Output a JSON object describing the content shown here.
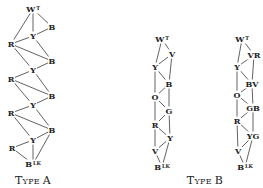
{
  "diagrams": [
    {
      "caption_first": "T",
      "caption_rest": "YPE A",
      "caption": "Type A",
      "nodes": [
        {
          "id": "a0",
          "label": "W",
          "sup": "T",
          "x": 33,
          "y": 9
        },
        {
          "id": "a1",
          "label": "B",
          "sup": "",
          "x": 52,
          "y": 27
        },
        {
          "id": "a2",
          "label": "Y",
          "sup": "",
          "x": 33,
          "y": 36
        },
        {
          "id": "a3",
          "label": "R",
          "sup": "",
          "x": 11,
          "y": 44
        },
        {
          "id": "a4",
          "label": "B",
          "sup": "",
          "x": 52,
          "y": 61
        },
        {
          "id": "a5",
          "label": "Y",
          "sup": "",
          "x": 33,
          "y": 70
        },
        {
          "id": "a6",
          "label": "R",
          "sup": "",
          "x": 11,
          "y": 79
        },
        {
          "id": "a7",
          "label": "B",
          "sup": "",
          "x": 52,
          "y": 96
        },
        {
          "id": "a8",
          "label": "Y",
          "sup": "",
          "x": 33,
          "y": 105
        },
        {
          "id": "a9",
          "label": "R",
          "sup": "",
          "x": 11,
          "y": 113
        },
        {
          "id": "a10",
          "label": "B",
          "sup": "",
          "x": 52,
          "y": 130
        },
        {
          "id": "a11",
          "label": "Y",
          "sup": "",
          "x": 33,
          "y": 140
        },
        {
          "id": "a12",
          "label": "R",
          "sup": "",
          "x": 12,
          "y": 148
        },
        {
          "id": "a13",
          "label": "B",
          "sup": "LK",
          "x": 33,
          "y": 164
        }
      ],
      "edges": [
        [
          "a0",
          "a1"
        ],
        [
          "a0",
          "a2"
        ],
        [
          "a0",
          "a3"
        ],
        [
          "a2",
          "a1"
        ],
        [
          "a2",
          "a3"
        ],
        [
          "a3",
          "a4"
        ],
        [
          "a2",
          "a4"
        ],
        [
          "a4",
          "a5"
        ],
        [
          "a3",
          "a5"
        ],
        [
          "a5",
          "a6"
        ],
        [
          "a6",
          "a7"
        ],
        [
          "a5",
          "a7"
        ],
        [
          "a7",
          "a8"
        ],
        [
          "a6",
          "a8"
        ],
        [
          "a8",
          "a9"
        ],
        [
          "a9",
          "a10"
        ],
        [
          "a8",
          "a10"
        ],
        [
          "a10",
          "a11"
        ],
        [
          "a9",
          "a11"
        ],
        [
          "a11",
          "a12"
        ],
        [
          "a11",
          "a13"
        ],
        [
          "a12",
          "a13"
        ],
        [
          "a10",
          "a13"
        ]
      ]
    },
    {
      "caption": "Type B (left)",
      "nodes": [
        {
          "id": "b0",
          "label": "W",
          "sup": "T",
          "x": 162,
          "y": 39
        },
        {
          "id": "b1",
          "label": "V",
          "sup": "",
          "x": 172,
          "y": 54
        },
        {
          "id": "b2",
          "label": "Y",
          "sup": "",
          "x": 155,
          "y": 67
        },
        {
          "id": "b3",
          "label": "B",
          "sup": "",
          "x": 169,
          "y": 84
        },
        {
          "id": "b4",
          "label": "O",
          "sup": "",
          "x": 155,
          "y": 97
        },
        {
          "id": "b5",
          "label": "G",
          "sup": "",
          "x": 169,
          "y": 111
        },
        {
          "id": "b6",
          "label": "R",
          "sup": "",
          "x": 155,
          "y": 125
        },
        {
          "id": "b7",
          "label": "Y",
          "sup": "",
          "x": 170,
          "y": 138
        },
        {
          "id": "b8",
          "label": "V",
          "sup": "",
          "x": 155,
          "y": 151
        },
        {
          "id": "b9",
          "label": "B",
          "sup": "LK",
          "x": 162,
          "y": 167
        }
      ],
      "edges": [
        [
          "b0",
          "b1"
        ],
        [
          "b0",
          "b2"
        ],
        [
          "b1",
          "b2"
        ],
        [
          "b1",
          "b3"
        ],
        [
          "b2",
          "b3"
        ],
        [
          "b2",
          "b4"
        ],
        [
          "b3",
          "b4"
        ],
        [
          "b3",
          "b5"
        ],
        [
          "b4",
          "b5"
        ],
        [
          "b4",
          "b6"
        ],
        [
          "b5",
          "b6"
        ],
        [
          "b5",
          "b7"
        ],
        [
          "b6",
          "b7"
        ],
        [
          "b6",
          "b8"
        ],
        [
          "b7",
          "b8"
        ],
        [
          "b7",
          "b9"
        ],
        [
          "b8",
          "b9"
        ]
      ]
    },
    {
      "caption": "Type B (right)",
      "nodes": [
        {
          "id": "c0",
          "label": "W",
          "sup": "T",
          "x": 242,
          "y": 39
        },
        {
          "id": "c1",
          "label": "VR",
          "sup": "",
          "x": 254,
          "y": 55
        },
        {
          "id": "c2",
          "label": "Y",
          "sup": "",
          "x": 237,
          "y": 67
        },
        {
          "id": "c3",
          "label": "BV",
          "sup": "",
          "x": 252,
          "y": 84
        },
        {
          "id": "c4",
          "label": "O",
          "sup": "",
          "x": 237,
          "y": 95
        },
        {
          "id": "c5",
          "label": "GB",
          "sup": "",
          "x": 253,
          "y": 108
        },
        {
          "id": "c6",
          "label": "R",
          "sup": "",
          "x": 237,
          "y": 121
        },
        {
          "id": "c7",
          "label": "YG",
          "sup": "",
          "x": 253,
          "y": 136
        },
        {
          "id": "c8",
          "label": "V",
          "sup": "",
          "x": 238,
          "y": 151
        },
        {
          "id": "c9",
          "label": "B",
          "sup": "LK",
          "x": 245,
          "y": 167
        }
      ],
      "edges": [
        [
          "c0",
          "c1"
        ],
        [
          "c0",
          "c2"
        ],
        [
          "c1",
          "c2"
        ],
        [
          "c1",
          "c3"
        ],
        [
          "c2",
          "c3"
        ],
        [
          "c2",
          "c4"
        ],
        [
          "c3",
          "c4"
        ],
        [
          "c3",
          "c5"
        ],
        [
          "c4",
          "c5"
        ],
        [
          "c4",
          "c6"
        ],
        [
          "c5",
          "c6"
        ],
        [
          "c5",
          "c7"
        ],
        [
          "c6",
          "c7"
        ],
        [
          "c6",
          "c8"
        ],
        [
          "c7",
          "c8"
        ],
        [
          "c7",
          "c9"
        ],
        [
          "c8",
          "c9"
        ]
      ]
    }
  ],
  "captions": {
    "type_a": {
      "big1": "T",
      "small1": "YPE ",
      "big2": "A",
      "x": 33,
      "y": 184
    },
    "type_b": {
      "big1": "T",
      "small1": "YPE ",
      "big2": "B",
      "x": 205,
      "y": 184
    }
  }
}
